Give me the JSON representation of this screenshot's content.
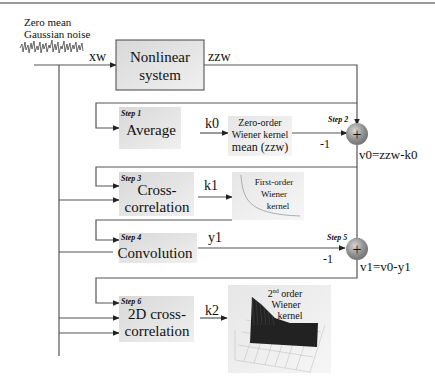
{
  "input": {
    "label_line1": "Zero mean",
    "label_line2": "Gaussian noise",
    "signal": "xw"
  },
  "system": {
    "label_line1": "Nonlinear",
    "label_line2": "system",
    "output": "zzw"
  },
  "steps": [
    {
      "step": "Step 1",
      "label_line1": "Average",
      "label_line2": "",
      "output": "k0"
    },
    {
      "step": "Step 2",
      "type": "sum",
      "minus": "-1",
      "result": "v0=zzw-k0"
    },
    {
      "step": "Step 3",
      "label_line1": "Cross-",
      "label_line2": "correlation",
      "output": "k1"
    },
    {
      "step": "Step 4",
      "label_line1": "Convolution",
      "label_line2": "",
      "output": "y1"
    },
    {
      "step": "Step 5",
      "type": "sum",
      "minus": "-1",
      "result": "v1=v0-y1"
    },
    {
      "step": "Step 6",
      "label_line1": "2D cross-",
      "label_line2": "correlation",
      "output": "k2"
    }
  ],
  "kernels": {
    "zero_order": {
      "line1": "Zero-order",
      "line2": "Wiener kernel",
      "line3": "mean (zzw)"
    },
    "first_order": {
      "line1": "First-order",
      "line2": "Wiener",
      "line3": "kernel"
    },
    "second_order": {
      "line1_num": "2",
      "line1_sup": "nd",
      "line1_rest": " order",
      "line2": "Wiener",
      "line3": "kernel"
    }
  },
  "sum_symbol": "+",
  "colors": {
    "block_fill": "#e4e4e4",
    "wire": "#555555",
    "sum_node": "#8a8a8a"
  }
}
